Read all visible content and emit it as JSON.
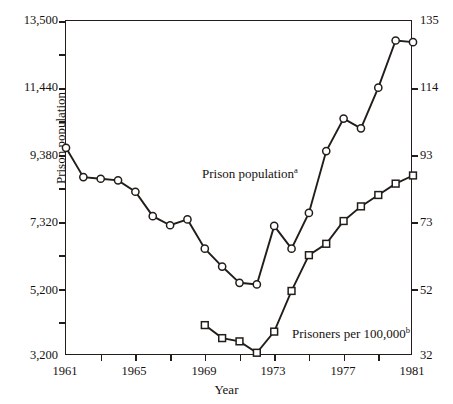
{
  "chart_data": {
    "type": "line",
    "title": "",
    "xlabel": "Year",
    "ylabel_left": "Prison population",
    "ylabel_right": "Prisoners per 100,000",
    "grid": false,
    "legend_position": "inline-annotation",
    "x": [
      1961,
      1962,
      1963,
      1964,
      1965,
      1966,
      1967,
      1968,
      1969,
      1970,
      1971,
      1972,
      1973,
      1974,
      1975,
      1976,
      1977,
      1978,
      1979,
      1980,
      1981
    ],
    "xlim": [
      1961,
      1981
    ],
    "xticks": [
      1961,
      1963,
      1965,
      1967,
      1969,
      1971,
      1973,
      1975,
      1977,
      1979,
      1981
    ],
    "xticklabels": [
      "1961",
      "",
      "1965",
      "",
      "1969",
      "",
      "1973",
      "",
      "1977",
      "",
      "1981"
    ],
    "ylim_left": [
      3200,
      13500
    ],
    "yticks_left": [
      3200,
      5200,
      7320,
      9380,
      11440,
      13500
    ],
    "yticklabels_left": [
      "3,200",
      "5,200",
      "7,320",
      "9,380",
      "11,440",
      "13,500"
    ],
    "ylim_right": [
      32,
      135
    ],
    "yticks_right": [
      32,
      52,
      73,
      93,
      114,
      135
    ],
    "yticklabels_right": [
      "32",
      "52",
      "73",
      "93",
      "114",
      "135"
    ],
    "minor_yticks_left": [
      4200,
      6260,
      8350,
      10410,
      12470
    ],
    "series": [
      {
        "name": "Prison population",
        "annotation": "Prison population",
        "annotation_superscript": "a",
        "axis": "left",
        "marker": "circle",
        "x": [
          1961,
          1962,
          1963,
          1964,
          1965,
          1966,
          1967,
          1968,
          1969,
          1970,
          1971,
          1972,
          1973,
          1974,
          1975,
          1976,
          1977,
          1978,
          1979,
          1980,
          1981
        ],
        "values": [
          9600,
          8700,
          8650,
          8600,
          8250,
          7500,
          7220,
          7400,
          6500,
          5950,
          5450,
          5400,
          7200,
          6500,
          7600,
          9500,
          10500,
          10200,
          11450,
          12900,
          12850
        ]
      },
      {
        "name": "Prisoners per 100,000",
        "annotation": "Prisoners per 100,000",
        "annotation_superscript": "b",
        "axis": "right",
        "marker": "square",
        "x": [
          1969,
          1970,
          1971,
          1972,
          1973,
          1974,
          1975,
          1976,
          1977,
          1978,
          1979,
          1980,
          1981
        ],
        "values": [
          41.5,
          37.5,
          36.5,
          33.0,
          39.5,
          52.0,
          63.0,
          66.5,
          73.5,
          78.0,
          81.5,
          85.0,
          87.5
        ]
      }
    ],
    "footnote_markers": [
      "a",
      "b"
    ]
  },
  "axes": {
    "left_title": "Prison population",
    "right_title": "Prisoners per 100,000",
    "bottom_title": "Year"
  },
  "colors": {
    "line": "#221d19",
    "marker_fill": "#ffffff",
    "axis": "#221d19",
    "background": "#ffffff",
    "text": "#16120f"
  }
}
